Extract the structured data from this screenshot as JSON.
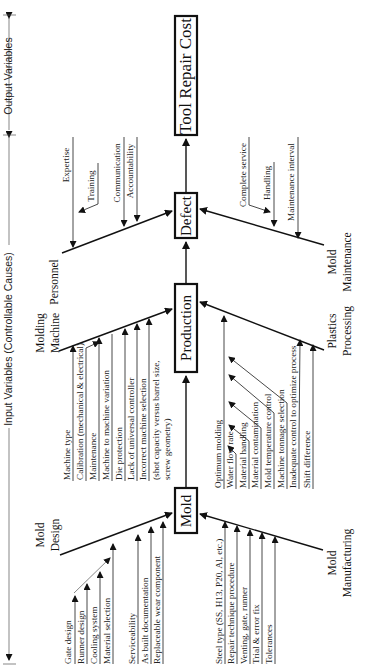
{
  "axis": {
    "input_label": "Input Variables (Controllable Causes)",
    "output_label": "Output Variables"
  },
  "effect": "Tool Repair Cost",
  "spine": [
    "Mold",
    "Production",
    "Defect",
    "Tool Repair Cost"
  ],
  "nodes": {
    "mold": "Mold",
    "production": "Production",
    "defect": "Defect",
    "output": "Tool Repair Cost"
  },
  "categories": {
    "mold_design": {
      "line1": "Mold",
      "line2": "Design",
      "causes": [
        "Gate design",
        "Runner design",
        "Cooling system",
        "Material selection",
        "Serviceability",
        "As built documentation",
        "Replaceable wear component"
      ]
    },
    "mold_manufacturing": {
      "line1": "Mold",
      "line2": "Manufacturing",
      "causes": [
        "Steel type (SS, H13, P20, Al, etc.)",
        "Repair technique procedure",
        "Venting, gate, runner",
        "Trial & error fix",
        "Tolerances"
      ]
    },
    "molding_machine": {
      "line1": "Molding",
      "line2": "Machine",
      "causes": [
        "Machine type",
        "Calibration (mechanical & electrical)",
        "Maintenance",
        "Machine to machine variation",
        "Die protection",
        "Lack of universal controller",
        "Incorrect machine selection",
        "(shot capacity versus barrel size,",
        "screw geometry)"
      ]
    },
    "plastics_processing": {
      "line1": "Plastics",
      "line2": "Processing",
      "causes": [
        "Optimum molding",
        "Water flow rate",
        "Material handling",
        "Material contamination",
        "Mold temperature control",
        "Machine tonnage selection",
        "Inadequate control to optimize process",
        "Shift difference"
      ]
    },
    "personnel": {
      "line1": "Personnel",
      "causes": [
        "Expertise",
        "Training",
        "Communication",
        "Accountability"
      ]
    },
    "mold_maintenance": {
      "line1": "Mold",
      "line2": "Maintenance",
      "causes": [
        "Complete service",
        "Handling",
        "Maintenance interval"
      ]
    }
  }
}
